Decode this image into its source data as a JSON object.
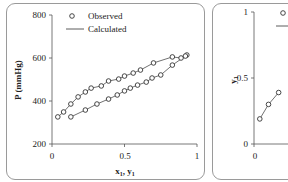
{
  "chart_data": [
    {
      "type": "scatter",
      "title": "",
      "xlabel": "x1, y1",
      "ylabel": "P (mmHg)",
      "xlim": [
        0,
        1
      ],
      "ylim": [
        200,
        800
      ],
      "xticks": [
        "0",
        "0.5",
        "1"
      ],
      "yticks": [
        "200",
        "400",
        "600",
        "800"
      ],
      "grid": false,
      "legend": {
        "position": "upper-left",
        "entries": [
          "Observed",
          "Calculated"
        ]
      },
      "series": [
        {
          "name": "Observed (bubble, x1)",
          "marker": "open-circle",
          "x": [
            0.04,
            0.08,
            0.13,
            0.18,
            0.23,
            0.27,
            0.34,
            0.39,
            0.46,
            0.5,
            0.56,
            0.61,
            0.7,
            0.83,
            0.89,
            0.93
          ],
          "y": [
            326,
            349,
            386,
            419,
            442,
            460,
            470,
            493,
            502,
            516,
            530,
            544,
            577,
            605,
            600,
            614
          ]
        },
        {
          "name": "Observed (dew, y1)",
          "marker": "open-circle",
          "x": [
            0.13,
            0.23,
            0.31,
            0.39,
            0.45,
            0.5,
            0.54,
            0.59,
            0.65,
            0.69,
            0.75,
            0.83,
            0.92
          ],
          "y": [
            326,
            358,
            386,
            409,
            428,
            447,
            460,
            474,
            488,
            507,
            521,
            567,
            609
          ]
        },
        {
          "name": "Calculated",
          "line": "solid",
          "x": [
            0.04,
            0.13,
            0.23,
            0.34,
            0.46,
            0.56,
            0.7,
            0.83,
            0.93
          ],
          "y": [
            326,
            386,
            442,
            470,
            502,
            530,
            577,
            605,
            614
          ]
        }
      ]
    },
    {
      "type": "scatter",
      "title": "",
      "xlabel": "",
      "ylabel": "y1",
      "xlim": [
        0,
        1
      ],
      "ylim": [
        0,
        1
      ],
      "xticks": [
        "0"
      ],
      "yticks": [
        "0",
        "0.5",
        "1"
      ],
      "grid": false,
      "legend": {
        "position": "upper-left",
        "entries": [
          "Observed",
          "Calculated"
        ]
      },
      "series": [
        {
          "name": "Observed",
          "marker": "open-circle",
          "x": [
            0.04,
            0.1,
            0.17
          ],
          "y": [
            0.19,
            0.3,
            0.39
          ]
        },
        {
          "name": "Calculated",
          "line": "solid",
          "x": [
            0.03,
            0.1,
            0.2
          ],
          "y": [
            0.15,
            0.3,
            0.45
          ]
        }
      ]
    }
  ],
  "panels": {
    "left": {
      "ylabel": "P (mmHg)",
      "xlabel": "x1, y1",
      "xlabel_main": "x",
      "xlabel_sub1": "1",
      "xlabel_sep": ", y",
      "xlabel_sub2": "1",
      "yticks": [
        "800",
        "600",
        "400",
        "200"
      ],
      "xticks": [
        "0",
        "0.5",
        "1"
      ],
      "legend": {
        "observed": "Observed",
        "calculated": "Calculated"
      }
    },
    "right": {
      "ylabel_main": "y",
      "ylabel_sub": "1",
      "yticks": [
        "1",
        "0.5",
        "0"
      ],
      "xticks": [
        "0"
      ],
      "legend": {
        "observed_marker": "o"
      }
    }
  },
  "colors": {
    "marker": "#333333",
    "line": "#333333",
    "axis": "#555555",
    "border": "#9a9a9a"
  }
}
